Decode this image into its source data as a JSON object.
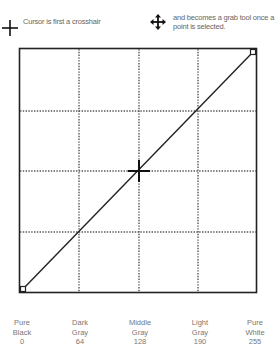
{
  "legend": {
    "crosshair_icon": "crosshair-icon",
    "crosshair_text": "Cursor is first a crosshair",
    "grab_icon": "move-arrows-icon",
    "grab_text_line1": "and becomes a grab tool once a",
    "grab_text_line2": "point is selected."
  },
  "curve": {
    "grid_divisions": 4,
    "points": [
      [
        0,
        0
      ],
      [
        128,
        128
      ],
      [
        255,
        255
      ]
    ],
    "line_color": "#222222",
    "grid_color": "#555555"
  },
  "x_labels": [
    {
      "line1": "Pure",
      "line2": "Black",
      "value": "0"
    },
    {
      "line1": "Dark",
      "line2": "Gray",
      "value": "64"
    },
    {
      "line1": "Middle",
      "line2": "Gray",
      "value": "128"
    },
    {
      "line1": "Light",
      "line2": "Gray",
      "value": "190"
    },
    {
      "line1": "Pure",
      "line2": "White",
      "value": "255"
    }
  ]
}
